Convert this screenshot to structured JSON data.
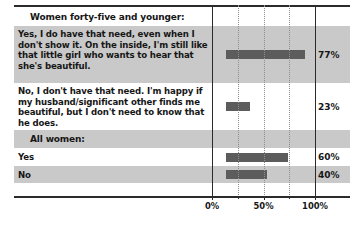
{
  "chart_data": {
    "type": "bar",
    "orientation": "horizontal",
    "title": "",
    "xlabel": "",
    "ylabel": "",
    "xlim": [
      0,
      100
    ],
    "grid": true,
    "legend": false,
    "axis": {
      "ticks": [
        {
          "value": 0,
          "label": "0%"
        },
        {
          "value": 50,
          "label": "50%"
        },
        {
          "value": 100,
          "label": "100%"
        }
      ],
      "gridlines": [
        0,
        25,
        50,
        75,
        100
      ],
      "solid_gridlines": [
        0,
        100
      ],
      "dotted_gridlines": [
        25,
        50,
        75
      ]
    },
    "sections": [
      {
        "header": "Women forty-five and younger:",
        "rows": [
          {
            "label": "Yes, I do have that need, even when I don't show it. On the inside, I'm still like that little girl who wants to hear that she's beautiful.",
            "value": 77,
            "value_label": "77%"
          },
          {
            "label": "No, I don't have that need. I'm happy if my husband/significant other finds me beautiful, but I don't need to know that he does.",
            "value": 23,
            "value_label": "23%"
          }
        ]
      },
      {
        "header": "All women:",
        "rows": [
          {
            "label": "Yes",
            "value": 60,
            "value_label": "60%"
          },
          {
            "label": "No",
            "value": 40,
            "value_label": "40%"
          }
        ]
      }
    ],
    "colors": {
      "bar": "#5c5c5c",
      "shaded_row": "#c9c9c9",
      "plain_row": "#ffffff",
      "rule": "#2b2b2b",
      "gridline_dotted": "#8e8e8e",
      "text": "#161616"
    }
  }
}
